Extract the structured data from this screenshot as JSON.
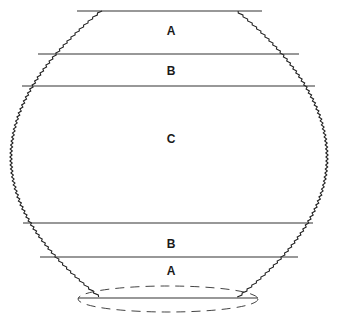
{
  "diagram": {
    "zones": [
      {
        "label": "A",
        "position": "top"
      },
      {
        "label": "B",
        "position": "upper-middle"
      },
      {
        "label": "C",
        "position": "center"
      },
      {
        "label": "B",
        "position": "lower-middle"
      },
      {
        "label": "A",
        "position": "bottom"
      }
    ],
    "base": {
      "style": "dashed-ellipse"
    },
    "colors": {
      "stroke": "#222222",
      "background": "#ffffff"
    }
  }
}
